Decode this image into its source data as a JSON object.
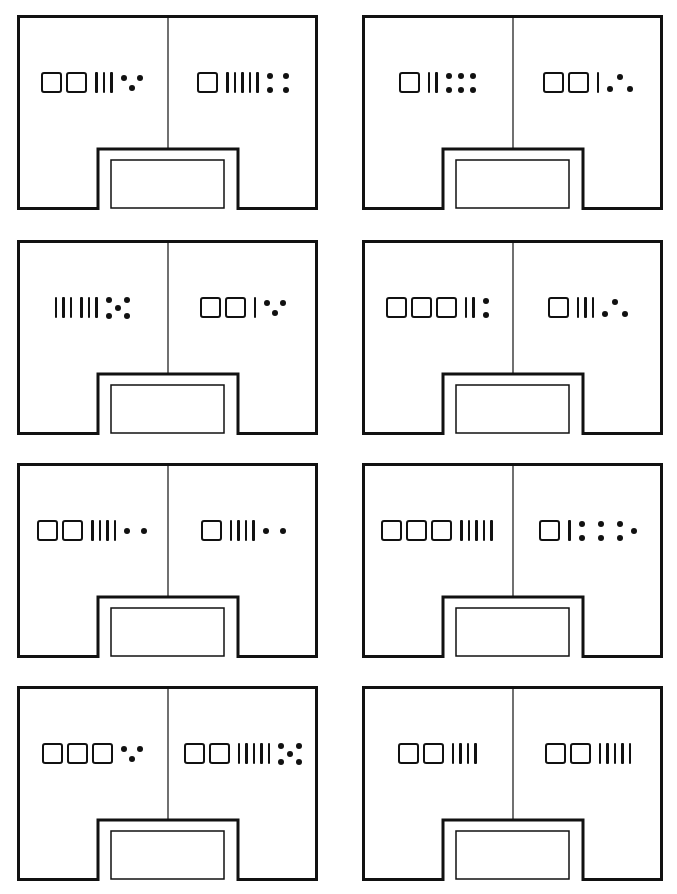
{
  "page": {
    "background": "#ffffff",
    "ink": "#111111"
  },
  "cards": [
    {
      "id": 1,
      "left": {
        "squares": 2,
        "stick_groups": [
          3
        ],
        "dots": 3,
        "dot_pattern": "v"
      },
      "right": {
        "squares": 1,
        "stick_groups": [
          5
        ],
        "dots": 4,
        "dot_pattern": "square"
      }
    },
    {
      "id": 2,
      "left": {
        "squares": 1,
        "stick_groups": [
          2
        ],
        "dots": 6,
        "dot_pattern": "grid3x2"
      },
      "right": {
        "squares": 2,
        "stick_groups": [
          1
        ],
        "dots": 3,
        "dot_pattern": "triangle"
      }
    },
    {
      "id": 3,
      "left": {
        "squares": 0,
        "stick_groups": [
          3,
          3
        ],
        "dots": 5,
        "dot_pattern": "quincunx"
      },
      "right": {
        "squares": 2,
        "stick_groups": [
          1
        ],
        "dots": 3,
        "dot_pattern": "v"
      }
    },
    {
      "id": 4,
      "left": {
        "squares": 3,
        "stick_groups": [
          2
        ],
        "dots": 2,
        "dot_pattern": "vertical"
      },
      "right": {
        "squares": 1,
        "stick_groups": [
          3
        ],
        "dots": 3,
        "dot_pattern": "triangle"
      }
    },
    {
      "id": 5,
      "left": {
        "squares": 2,
        "stick_groups": [
          4
        ],
        "dots": 2,
        "dot_pattern": "horizontal"
      },
      "right": {
        "squares": 1,
        "stick_groups": [
          4
        ],
        "dots": 2,
        "dot_pattern": "horizontal"
      }
    },
    {
      "id": 6,
      "left": {
        "squares": 3,
        "stick_groups": [
          5
        ],
        "dots": 0,
        "dot_pattern": "none"
      },
      "right": {
        "squares": 1,
        "stick_groups": [
          1
        ],
        "dots": 7,
        "dot_pattern": "grid3x2plus1"
      }
    },
    {
      "id": 7,
      "left": {
        "squares": 3,
        "stick_groups": [],
        "dots": 3,
        "dot_pattern": "v"
      },
      "right": {
        "squares": 2,
        "stick_groups": [
          5
        ],
        "dots": 5,
        "dot_pattern": "quincunx"
      }
    },
    {
      "id": 8,
      "left": {
        "squares": 2,
        "stick_groups": [
          4
        ],
        "dots": 0,
        "dot_pattern": "none"
      },
      "right": {
        "squares": 2,
        "stick_groups": [
          5
        ],
        "dots": 0,
        "dot_pattern": "none"
      }
    }
  ]
}
